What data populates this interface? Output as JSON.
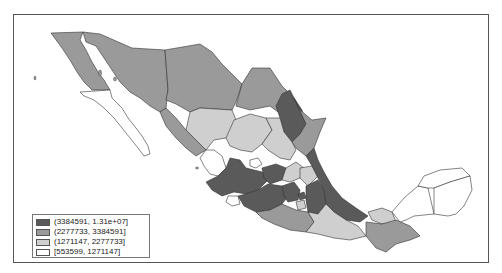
{
  "map": {
    "title": "",
    "region": "Mexico (states)",
    "type": "choropleth",
    "colors": {
      "class1": "#5a5a5a",
      "class2": "#9a9a9a",
      "class3": "#cfcfcf",
      "class4": "#ffffff",
      "border": "#333333",
      "frame": "#555555"
    }
  },
  "legend": {
    "items": [
      {
        "label": "(3384591, 1.31e+07]",
        "color": "#5a5a5a"
      },
      {
        "label": "(2277733, 3384591]",
        "color": "#9a9a9a"
      },
      {
        "label": "(1271147, 2277733]",
        "color": "#cfcfcf"
      },
      {
        "label": "[553599, 1271147]",
        "color": "#ffffff"
      }
    ]
  }
}
